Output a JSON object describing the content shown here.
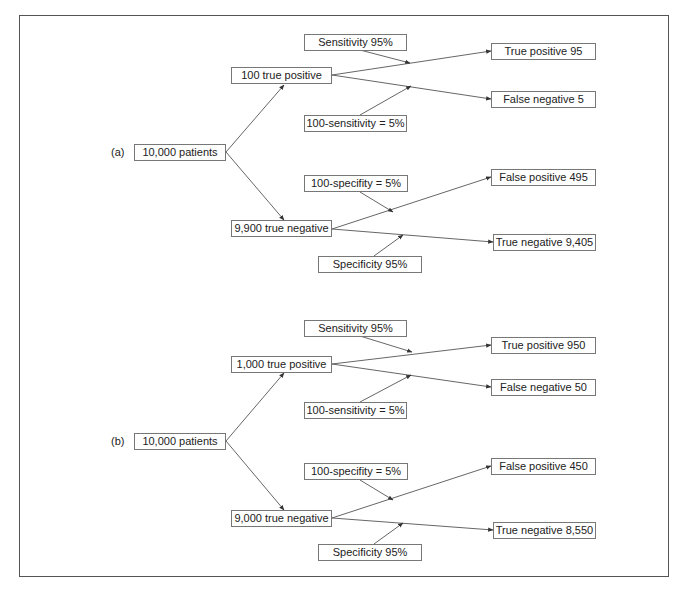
{
  "panels": [
    {
      "label": "(a)",
      "root": "10,000 patients",
      "positive_node": "100 true positive",
      "negative_node": "9,900 true negative",
      "sensitivity": "Sensitivity 95%",
      "one_minus_sensitivity": "100-sensitivity = 5%",
      "one_minus_specificity": "100-specifity = 5%",
      "specificity": "Specificity 95%",
      "true_positive": "True positive 95",
      "false_negative": "False negative 5",
      "false_positive": "False positive 495",
      "true_negative": "True negative 9,405"
    },
    {
      "label": "(b)",
      "root": "10,000 patients",
      "positive_node": "1,000 true positive",
      "negative_node": "9,000 true negative",
      "sensitivity": "Sensitivity 95%",
      "one_minus_sensitivity": "100-sensitivity = 5%",
      "one_minus_specificity": "100-specifity = 5%",
      "specificity": "Specificity 95%",
      "true_positive": "True positive 950",
      "false_negative": "False negative 50",
      "false_positive": "False positive 450",
      "true_negative": "True negative 8,550"
    }
  ],
  "colors": {
    "line": "#555555",
    "box_border": "#777777",
    "text": "#222222"
  }
}
